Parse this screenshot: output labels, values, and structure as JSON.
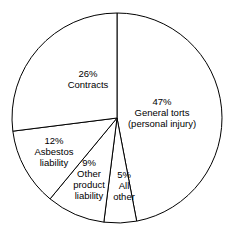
{
  "chart_data": {
    "type": "pie",
    "title": "",
    "subtitle": "",
    "xlabel": "",
    "ylabel": "",
    "legend_position": "none",
    "grid": false,
    "start_angle_deg": 0,
    "direction": "clockwise",
    "units": "percent",
    "categories": [
      "General torts (personal injury)",
      "All other",
      "Other product liability",
      "Asbestos liability",
      "Contracts"
    ],
    "values": [
      47,
      5,
      9,
      12,
      26
    ],
    "slices": [
      {
        "id": "general-torts",
        "percent_text": "47%",
        "value": 47,
        "label_lines": [
          "47%",
          "General torts",
          "(personal injury)"
        ],
        "label_x": 162,
        "label_y": 113,
        "start_deg": 0,
        "end_deg": 169.2
      },
      {
        "id": "all-other",
        "percent_text": "5%",
        "value": 5,
        "label_lines": [
          "5%",
          "All",
          "other"
        ],
        "label_x": 124,
        "label_y": 186,
        "start_deg": 169.2,
        "end_deg": 187.2
      },
      {
        "id": "other-product-liability",
        "percent_text": "9%",
        "value": 9,
        "label_lines": [
          "9%",
          "Other",
          "product",
          "liability"
        ],
        "label_x": 89,
        "label_y": 179,
        "start_deg": 187.2,
        "end_deg": 219.6
      },
      {
        "id": "asbestos-liability",
        "percent_text": "12%",
        "value": 12,
        "label_lines": [
          "12%",
          "Asbestos",
          "liability"
        ],
        "label_x": 54,
        "label_y": 152,
        "start_deg": 219.6,
        "end_deg": 262.8
      },
      {
        "id": "contracts",
        "percent_text": "26%",
        "value": 26,
        "label_lines": [
          "26%",
          "Contracts"
        ],
        "label_x": 88,
        "label_y": 79,
        "start_deg": 262.8,
        "end_deg": 360
      }
    ],
    "geometry": {
      "center_x": 117,
      "center_y": 118,
      "radius": 105
    },
    "colors": {
      "slice_fill": "#ffffff",
      "slice_stroke": "#000000",
      "background": "#ffffff",
      "text": "#000000"
    }
  }
}
